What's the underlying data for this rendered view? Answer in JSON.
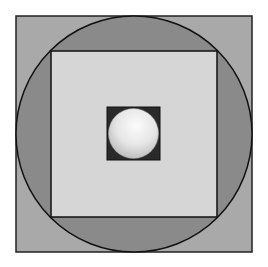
{
  "diagram": {
    "colors": {
      "background": "#ffffff",
      "outer_square_fill": "#a9a9a9",
      "circle_fill": "#8a8a8a",
      "inner_square_fill": "#d6d6d6",
      "center_square_fill": "#2a2a2a",
      "sphere_light": "#f4f4f4",
      "sphere_dark": "#bdbdbd",
      "stroke": "#111111"
    },
    "shapes": {
      "outer_square": {
        "x": 16,
        "y": 16,
        "size": 236
      },
      "circle": {
        "cx": 134,
        "cy": 134,
        "r": 118
      },
      "inner_square": {
        "x": 51,
        "y": 51,
        "size": 166
      },
      "center_square": {
        "x": 107,
        "y": 107,
        "size": 53
      },
      "sphere": {
        "cx": 133.5,
        "cy": 133.5,
        "r": 25
      }
    }
  }
}
